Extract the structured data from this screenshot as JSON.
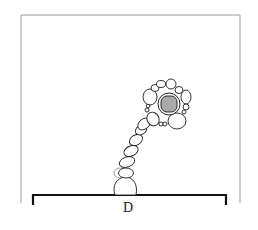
{
  "figure": {
    "type": "botanical line illustration",
    "panel_label": "D",
    "colors": {
      "line": "#1e1e1e",
      "frame": "#9a9a9a",
      "nucleus_fill": "#a9a9a9",
      "background": "#ffffff"
    }
  }
}
